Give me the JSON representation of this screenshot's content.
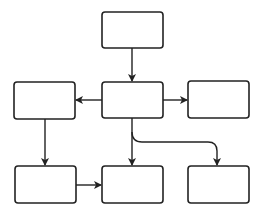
{
  "diagram": {
    "type": "flowchart",
    "stroke_color": "#222222",
    "fill_color": "#ffffff",
    "background": "#ffffff",
    "nodes": [
      {
        "id": "top",
        "label": "",
        "x": 102,
        "y": 12,
        "w": 61,
        "h": 36
      },
      {
        "id": "mid-left",
        "label": "",
        "x": 14,
        "y": 82,
        "w": 61,
        "h": 37
      },
      {
        "id": "mid-center",
        "label": "",
        "x": 102,
        "y": 82,
        "w": 61,
        "h": 36
      },
      {
        "id": "mid-right",
        "label": "",
        "x": 188,
        "y": 81,
        "w": 61,
        "h": 37
      },
      {
        "id": "bottom-left",
        "label": "",
        "x": 15,
        "y": 166,
        "w": 61,
        "h": 37
      },
      {
        "id": "bottom-center",
        "label": "",
        "x": 102,
        "y": 166,
        "w": 61,
        "h": 37
      },
      {
        "id": "bottom-right",
        "label": "",
        "x": 188,
        "y": 166,
        "w": 61,
        "h": 37
      }
    ],
    "edges": [
      {
        "from": "top",
        "to": "mid-center"
      },
      {
        "from": "mid-center",
        "to": "mid-left"
      },
      {
        "from": "mid-center",
        "to": "mid-right"
      },
      {
        "from": "mid-left",
        "to": "bottom-left"
      },
      {
        "from": "mid-center",
        "to": "bottom-center"
      },
      {
        "from": "mid-center",
        "to": "bottom-right",
        "style": "curved-elbow"
      },
      {
        "from": "bottom-left",
        "to": "bottom-center"
      }
    ]
  }
}
